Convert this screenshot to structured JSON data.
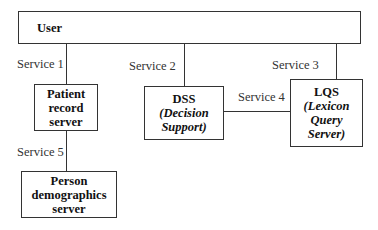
{
  "diagram": {
    "nodes": {
      "user": {
        "title": "User"
      },
      "patient": {
        "lines": [
          "Patient",
          "record",
          "server"
        ]
      },
      "dss": {
        "title": "DSS",
        "subtitle_lines": [
          "(Decision",
          "Support)"
        ]
      },
      "lqs": {
        "title": "LQS",
        "subtitle_lines": [
          "(Lexicon",
          "Query",
          "Server)"
        ]
      },
      "person": {
        "lines": [
          "Person",
          "demographics",
          "server"
        ]
      }
    },
    "edges": [
      {
        "from": "User",
        "to": "Patient record server",
        "label": "Service 1"
      },
      {
        "from": "User",
        "to": "DSS",
        "label": "Service 2"
      },
      {
        "from": "User",
        "to": "LQS",
        "label": "Service 3"
      },
      {
        "from": "DSS",
        "to": "LQS",
        "label": "Service 4"
      },
      {
        "from": "Patient record server",
        "to": "Person demographics server",
        "label": "Service 5"
      }
    ]
  }
}
